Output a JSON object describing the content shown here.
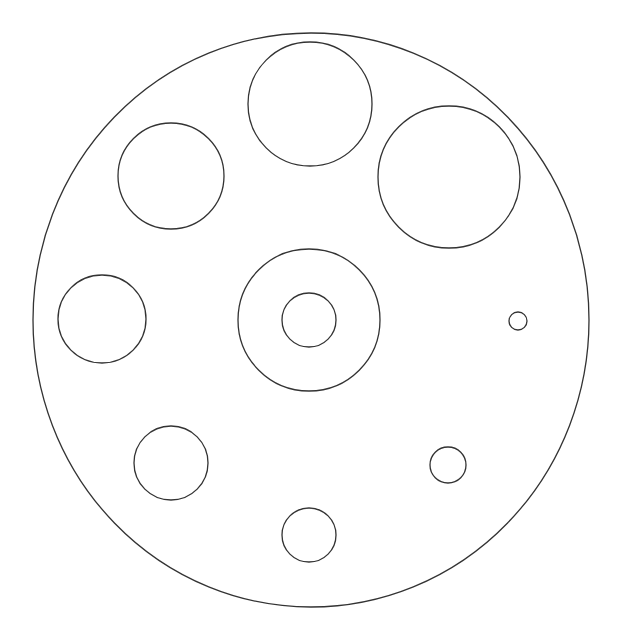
{
  "canvas": {
    "width": 617,
    "height": 643,
    "background": "#ffffff"
  },
  "style": {
    "stroke": "#333333",
    "stroke_width": 1.3
  },
  "outer_boundary": {
    "cx": 311,
    "cy": 320,
    "rx": 278,
    "ry": 287
  },
  "circles": [
    {
      "name": "top-circle",
      "cx": 310,
      "cy": 104,
      "r": 62
    },
    {
      "name": "upper-left-circle",
      "cx": 171,
      "cy": 176,
      "r": 53
    },
    {
      "name": "upper-right-circle",
      "cx": 449,
      "cy": 177,
      "r": 71
    },
    {
      "name": "center-outer-ring",
      "cx": 309,
      "cy": 320,
      "r": 71
    },
    {
      "name": "center-inner-circle",
      "cx": 309,
      "cy": 320,
      "r": 27
    },
    {
      "name": "left-circle",
      "cx": 102,
      "cy": 319,
      "r": 44
    },
    {
      "name": "right-small-circle",
      "cx": 518,
      "cy": 321,
      "r": 9
    },
    {
      "name": "lower-left-circle",
      "cx": 171,
      "cy": 463,
      "r": 37
    },
    {
      "name": "lower-right-circle",
      "cx": 448,
      "cy": 465,
      "r": 18
    },
    {
      "name": "bottom-circle",
      "cx": 309,
      "cy": 535,
      "r": 27
    }
  ]
}
